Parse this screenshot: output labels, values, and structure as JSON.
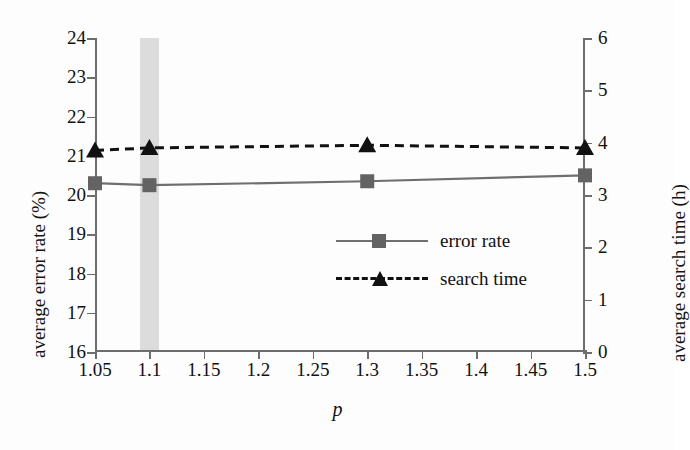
{
  "chart_data": {
    "type": "line",
    "title": "",
    "xlabel": "p",
    "ylabel": "average error rate (%)",
    "y2label": "average search time (h)",
    "x": [
      1.05,
      1.1,
      1.3,
      1.5
    ],
    "xlim": [
      1.05,
      1.5
    ],
    "ylim": [
      16,
      24
    ],
    "y2lim": [
      0,
      6
    ],
    "grid": false,
    "legend_position": "center-right",
    "xticks": [
      "1.05",
      "1.1",
      "1.15",
      "1.2",
      "1.25",
      "1.3",
      "1.35",
      "1.4",
      "1.45",
      "1.5"
    ],
    "xtick_values": [
      1.05,
      1.1,
      1.15,
      1.2,
      1.25,
      1.3,
      1.35,
      1.4,
      1.45,
      1.5
    ],
    "yticks": [
      "24",
      "23",
      "22",
      "21",
      "20",
      "19",
      "18",
      "17",
      "16"
    ],
    "ytick_values": [
      24,
      23,
      22,
      21,
      20,
      19,
      18,
      17,
      16
    ],
    "y2ticks": [
      "6",
      "5",
      "4",
      "3",
      "2",
      "1",
      "0"
    ],
    "y2tick_values": [
      6,
      5,
      4,
      3,
      2,
      1,
      0
    ],
    "annotations": [
      {
        "name": "highlight-band",
        "type": "vertical-band",
        "x_center": 1.1,
        "x_from": 1.095,
        "x_to": 1.105,
        "color": "#d6d6d6"
      }
    ],
    "series": [
      {
        "name": "error rate",
        "axis": "left",
        "marker": "square",
        "linestyle": "solid",
        "color": "#6f6f6f",
        "marker_color": "#636363",
        "values": [
          20.3,
          20.25,
          20.35,
          20.5
        ]
      },
      {
        "name": "search time",
        "axis": "right",
        "marker": "triangle",
        "linestyle": "dashed",
        "color": "#111111",
        "marker_color": "#111111",
        "values": [
          3.85,
          3.9,
          3.95,
          3.9
        ]
      }
    ]
  },
  "legend": {
    "items": [
      {
        "label": "error rate"
      },
      {
        "label": "search time"
      }
    ]
  }
}
